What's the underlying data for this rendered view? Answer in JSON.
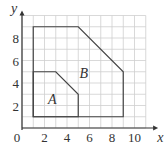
{
  "diagram": {
    "axes": {
      "x_label": "x",
      "y_label": "y",
      "origin_label": "0",
      "x_ticks": [
        "2",
        "4",
        "6",
        "8",
        "10"
      ],
      "y_ticks": [
        "2",
        "4",
        "6",
        "8"
      ],
      "x_range": [
        0,
        11
      ],
      "y_range": [
        0,
        10
      ],
      "grid": true
    },
    "shapes": [
      {
        "name": "A",
        "label": "A",
        "vertices": [
          [
            1,
            1
          ],
          [
            1,
            5
          ],
          [
            3,
            5
          ],
          [
            5,
            3
          ],
          [
            5,
            1
          ]
        ],
        "label_position": [
          2.7,
          2.6
        ]
      },
      {
        "name": "B",
        "label": "B",
        "vertices": [
          [
            1,
            1
          ],
          [
            1,
            9
          ],
          [
            5,
            9
          ],
          [
            9,
            5
          ],
          [
            9,
            1
          ]
        ],
        "label_position": [
          5.5,
          4.9
        ]
      }
    ],
    "colors": {
      "grid": "#cfcfcf",
      "axis": "#333333",
      "outline": "#444444"
    }
  }
}
